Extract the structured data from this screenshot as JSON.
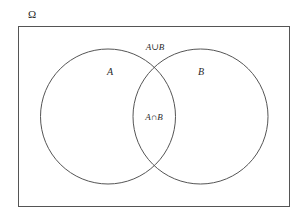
{
  "diagram": {
    "type": "venn",
    "universe": {
      "label": "Ω",
      "label_pos": [
        32,
        18
      ],
      "rect": {
        "x": 18,
        "y": 26,
        "width": 271,
        "height": 180
      }
    },
    "sets": [
      {
        "id": "A",
        "label": "A",
        "cx": 108,
        "cy": 116.5,
        "r": 67.5,
        "label_pos": [
          110,
          75
        ]
      },
      {
        "id": "B",
        "label": "B",
        "cx": 200.5,
        "cy": 116.5,
        "r": 67.5,
        "label_pos": [
          201,
          75
        ]
      }
    ],
    "annotations": {
      "union": {
        "label": "A∪B",
        "pos": [
          155,
          50
        ]
      },
      "intersection": {
        "label": "A∩B",
        "pos": [
          154,
          120
        ]
      }
    },
    "stroke_color": "#555555",
    "text_color": "#2a2a2a"
  }
}
